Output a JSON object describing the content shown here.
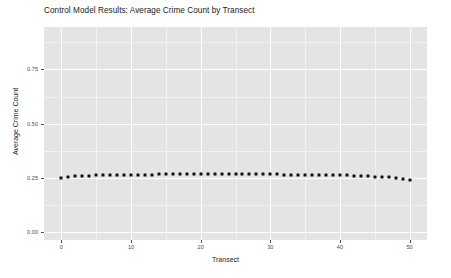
{
  "chart_data": {
    "type": "scatter",
    "title": "Control Model Results: Average Crime Count by Transect",
    "xlabel": "Transect",
    "ylabel": "Average Crime Count",
    "xlim": [
      -2.5,
      52.5
    ],
    "ylim": [
      -0.035,
      0.945
    ],
    "grid": true,
    "legend": null,
    "x_ticks": [
      0,
      10,
      20,
      30,
      40,
      50
    ],
    "x_tick_labels": [
      "0",
      "10",
      "20",
      "30",
      "40",
      "50"
    ],
    "y_ticks": [
      0.0,
      0.25,
      0.5,
      0.75
    ],
    "y_tick_labels": [
      "0.00",
      "0.25",
      "0.50",
      "0.75"
    ],
    "x_minor_ticks": [
      5,
      15,
      25,
      35,
      45
    ],
    "y_minor_ticks": [
      0.125,
      0.375,
      0.625,
      0.875
    ],
    "series": [
      {
        "name": "Average Crime Count",
        "marker": "filled-square",
        "color": "#111111",
        "x": [
          0,
          1,
          2,
          3,
          4,
          5,
          6,
          7,
          8,
          9,
          10,
          11,
          12,
          13,
          14,
          15,
          16,
          17,
          18,
          19,
          20,
          21,
          22,
          23,
          24,
          25,
          26,
          27,
          28,
          29,
          30,
          31,
          32,
          33,
          34,
          35,
          36,
          37,
          38,
          39,
          40,
          41,
          42,
          43,
          44,
          45,
          46,
          47,
          48,
          49,
          50
        ],
        "values": [
          0.251,
          0.256,
          0.258,
          0.259,
          0.261,
          0.262,
          0.262,
          0.263,
          0.263,
          0.264,
          0.264,
          0.265,
          0.266,
          0.266,
          0.267,
          0.268,
          0.267,
          0.268,
          0.269,
          0.269,
          0.268,
          0.269,
          0.269,
          0.268,
          0.269,
          0.27,
          0.268,
          0.268,
          0.268,
          0.267,
          0.267,
          0.267,
          0.266,
          0.266,
          0.266,
          0.265,
          0.265,
          0.264,
          0.264,
          0.263,
          0.263,
          0.262,
          0.261,
          0.26,
          0.259,
          0.257,
          0.256,
          0.254,
          0.251,
          0.247,
          0.242
        ]
      }
    ],
    "panel_background": "#e4e4e4",
    "gridline_major_color": "#ffffff",
    "gridline_minor_color": "#f2f2f2"
  }
}
